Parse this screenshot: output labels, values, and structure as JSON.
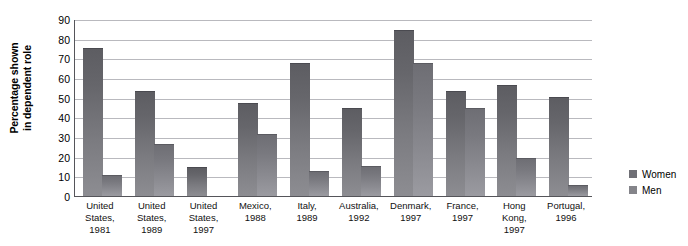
{
  "chart_data": {
    "type": "bar",
    "title": "",
    "subtitle": "",
    "xlabel": "",
    "ylabel": "Percentage shown\nin dependent role",
    "ylim": [
      0,
      90
    ],
    "yticks": [
      0,
      10,
      20,
      30,
      40,
      50,
      60,
      70,
      80,
      90
    ],
    "grid": true,
    "legend_position": "right",
    "categories": [
      "United States, 1981",
      "United States, 1989",
      "United States, 1997",
      "Mexico, 1988",
      "Italy, 1989",
      "Australia, 1992",
      "Denmark, 1997",
      "France, 1997",
      "Hong Kong, 1997",
      "Portugal, 1996"
    ],
    "series": [
      {
        "name": "Women",
        "color": "#6f6f75",
        "values": [
          75,
          53,
          14,
          47,
          67,
          44,
          84,
          53,
          56,
          50
        ]
      },
      {
        "name": "Men",
        "color": "#84848a",
        "values": [
          10,
          26,
          0,
          31,
          12,
          15,
          67,
          44,
          19,
          5
        ]
      }
    ]
  },
  "axis": {
    "y_title_line1": "Percentage shown",
    "y_title_line2": "in dependent role",
    "ytick_labels": [
      "90",
      "80",
      "70",
      "60",
      "50",
      "40",
      "30",
      "20",
      "10",
      "0"
    ]
  },
  "xlabels": [
    {
      "line1": "United",
      "line2": "States,",
      "line3": "1981"
    },
    {
      "line1": "United",
      "line2": "States,",
      "line3": "1989"
    },
    {
      "line1": "United",
      "line2": "States,",
      "line3": "1997"
    },
    {
      "line1": "Mexico,",
      "line2": "1988",
      "line3": ""
    },
    {
      "line1": "Italy,",
      "line2": "1989",
      "line3": ""
    },
    {
      "line1": "Australia,",
      "line2": "1992",
      "line3": ""
    },
    {
      "line1": "Denmark,",
      "line2": "1997",
      "line3": ""
    },
    {
      "line1": "France,",
      "line2": "1997",
      "line3": ""
    },
    {
      "line1": "Hong",
      "line2": "Kong,",
      "line3": "1997"
    },
    {
      "line1": "Portugal,",
      "line2": "1996",
      "line3": ""
    }
  ],
  "legend": {
    "items": [
      {
        "label": "Women",
        "color": "#6f6f75"
      },
      {
        "label": "Men",
        "color": "#84848a"
      }
    ]
  }
}
